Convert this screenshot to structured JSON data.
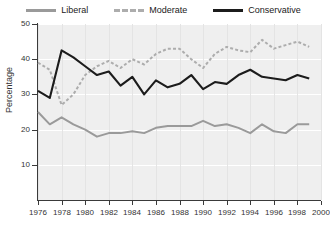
{
  "legend": {
    "position": "top-center",
    "items": [
      {
        "name": "Liberal",
        "style": "solid",
        "color": "#9a9a9a"
      },
      {
        "name": "Moderate",
        "style": "dashed",
        "color": "#adadad"
      },
      {
        "name": "Conservative",
        "style": "solid",
        "color": "#1c1c1c"
      }
    ]
  },
  "axes": {
    "ylabel": "Percentage",
    "xlabel": "",
    "yticks": [
      10,
      20,
      30,
      40,
      50
    ],
    "ytick_labels": [
      "10",
      "20",
      "30",
      "40",
      "50"
    ],
    "xticks": [
      1976,
      1978,
      1980,
      1982,
      1984,
      1986,
      1988,
      1990,
      1992,
      1994,
      1996,
      1998,
      2000
    ],
    "xtick_labels": [
      "1976",
      "1978",
      "1980",
      "1982",
      "1984",
      "1986",
      "1988",
      "1990",
      "1992",
      "1994",
      "1996",
      "1998",
      "2000"
    ]
  },
  "style": {
    "plot_background": "#efefef",
    "grid_color": "#ffffff",
    "axis_color": "#3a3a3a",
    "page_background": "#ffffff",
    "text_color": "#333333"
  },
  "chart_data": {
    "type": "line",
    "title": "",
    "subtitle": "",
    "xlabel": "",
    "ylabel": "Percentage",
    "xlim": [
      1976,
      2000
    ],
    "ylim": [
      0,
      50
    ],
    "grid": true,
    "legend_position": "top-center",
    "x": [
      1976,
      1977,
      1978,
      1979,
      1980,
      1981,
      1982,
      1983,
      1984,
      1985,
      1986,
      1987,
      1988,
      1989,
      1990,
      1991,
      1992,
      1993,
      1994,
      1995,
      1996,
      1997,
      1998,
      1999
    ],
    "series": [
      {
        "name": "Liberal",
        "color": "#9a9a9a",
        "linestyle": "solid",
        "values": [
          25.0,
          21.5,
          23.5,
          21.5,
          20.0,
          18.0,
          19.0,
          19.0,
          19.5,
          19.0,
          20.5,
          21.0,
          21.0,
          21.0,
          22.5,
          21.0,
          21.5,
          20.5,
          19.0,
          21.5,
          19.5,
          19.0,
          21.5,
          21.5
        ]
      },
      {
        "name": "Moderate",
        "color": "#adadad",
        "linestyle": "dashed",
        "values": [
          39.0,
          37.0,
          27.0,
          30.0,
          35.5,
          38.0,
          39.5,
          37.5,
          40.0,
          38.5,
          41.5,
          43.0,
          43.0,
          40.0,
          37.5,
          41.5,
          43.5,
          42.5,
          42.0,
          45.5,
          43.0,
          44.0,
          45.0,
          43.5
        ]
      },
      {
        "name": "Conservative",
        "color": "#1c1c1c",
        "linestyle": "solid",
        "values": [
          31.0,
          29.0,
          42.5,
          40.5,
          38.0,
          35.5,
          36.5,
          32.5,
          35.0,
          30.0,
          34.0,
          32.0,
          33.0,
          35.5,
          31.5,
          33.5,
          33.0,
          35.5,
          37.0,
          35.0,
          34.5,
          34.0,
          35.5,
          34.5
        ]
      }
    ]
  }
}
